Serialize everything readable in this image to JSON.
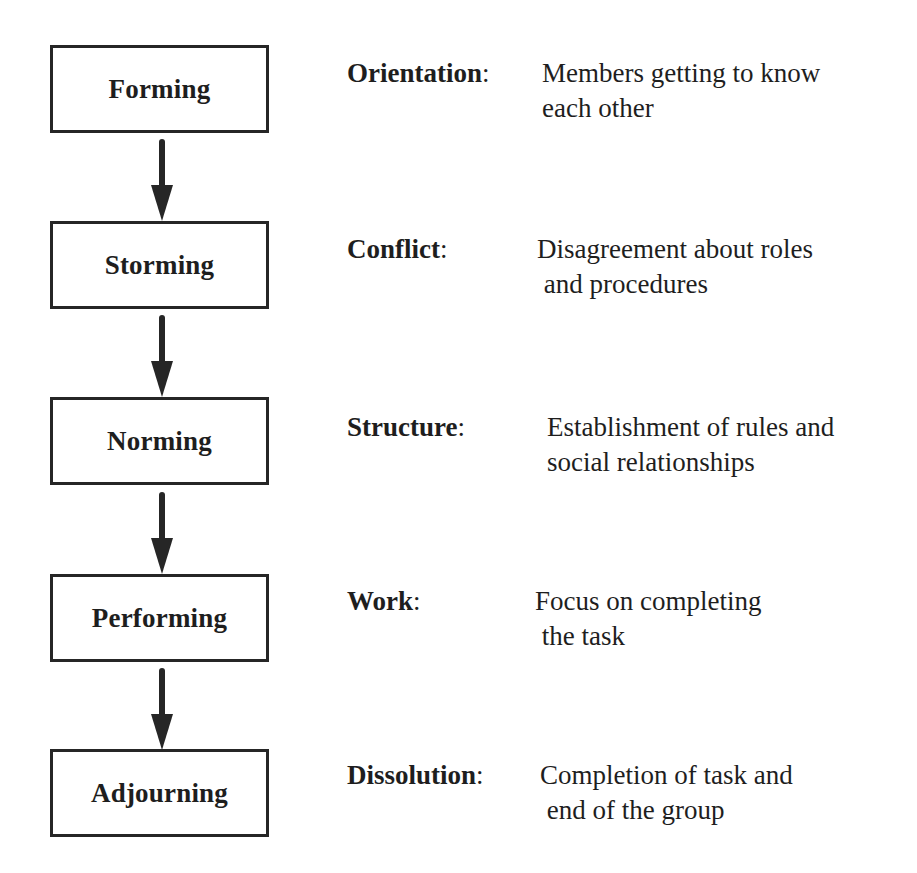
{
  "diagram": {
    "type": "flowchart",
    "title": "",
    "colors": {
      "box_border": "#262626",
      "arrow": "#262626",
      "text": "#1e1e1e",
      "background": "#ffffff"
    },
    "stages": [
      {
        "name": "Forming",
        "label": "Orientation",
        "colon": ":",
        "description_line1": "Members getting to know",
        "description_line2": "each other"
      },
      {
        "name": "Storming",
        "label": "Conflict",
        "colon": ":",
        "description_line1": "Disagreement about roles",
        "description_line2": " and procedures"
      },
      {
        "name": "Norming",
        "label": "Structure",
        "colon": ":",
        "description_line1": "Establishment of rules and",
        "description_line2": "social relationships"
      },
      {
        "name": "Performing",
        "label": "Work",
        "colon": ":",
        "description_line1": "Focus on completing",
        "description_line2": " the task"
      },
      {
        "name": "Adjourning",
        "label": "Dissolution",
        "colon": ":",
        "description_line1": "Completion of task and",
        "description_line2": " end of the group"
      }
    ],
    "arrows": [
      {
        "from": "Forming",
        "to": "Storming",
        "icon": "arrow-down-icon"
      },
      {
        "from": "Storming",
        "to": "Norming",
        "icon": "arrow-down-icon"
      },
      {
        "from": "Norming",
        "to": "Performing",
        "icon": "arrow-down-icon"
      },
      {
        "from": "Performing",
        "to": "Adjourning",
        "icon": "arrow-down-icon"
      }
    ]
  }
}
